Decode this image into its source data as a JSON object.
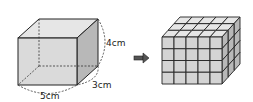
{
  "diagram": {
    "cuboid": {
      "length_label": "5cm",
      "depth_label": "3cm",
      "height_label": "4cm",
      "length": 5,
      "depth": 3,
      "height": 4
    },
    "arrow": {
      "direction": "right"
    },
    "unit_cubes": {
      "columns": 5,
      "rows": 4,
      "layers": 3
    },
    "colors": {
      "face_front": "#d4d4d4",
      "face_top": "#e6e6e6",
      "face_side": "#b8b8b8",
      "edge": "#222222"
    }
  }
}
